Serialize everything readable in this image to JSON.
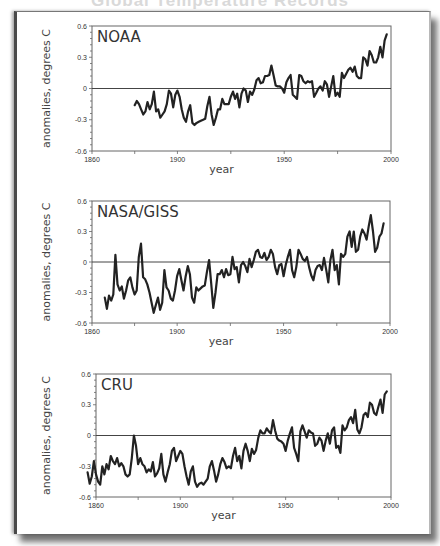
{
  "page": {
    "title_partial": "Global Temperature Records"
  },
  "chart_data": [
    {
      "type": "line",
      "title": "NOAA",
      "xlabel": "year",
      "ylabel": "anomalies, degrees C",
      "xlim": [
        1860,
        2000
      ],
      "ylim": [
        -0.6,
        0.6
      ],
      "xticks": [
        1860,
        1900,
        1950,
        2000
      ],
      "xtick_labels": [
        "1860",
        "1900",
        "1950",
        "2000"
      ],
      "yticks": [
        -0.6,
        -0.3,
        0,
        0.3,
        0.6
      ],
      "ytick_labels": [
        "-0.6",
        "-0.3",
        "0",
        "0.3",
        "0.6"
      ],
      "zero_line": true,
      "box": {
        "x0": 92,
        "x1": 391,
        "y_top": 26,
        "y_bottom": 151
      },
      "x": [
        1880,
        1881,
        1882,
        1883,
        1884,
        1885,
        1886,
        1887,
        1888,
        1889,
        1890,
        1891,
        1892,
        1893,
        1894,
        1895,
        1896,
        1897,
        1898,
        1899,
        1900,
        1901,
        1902,
        1903,
        1904,
        1905,
        1906,
        1907,
        1908,
        1909,
        1910,
        1911,
        1912,
        1913,
        1914,
        1915,
        1916,
        1917,
        1918,
        1919,
        1920,
        1921,
        1922,
        1923,
        1924,
        1925,
        1926,
        1927,
        1928,
        1929,
        1930,
        1931,
        1932,
        1933,
        1934,
        1935,
        1936,
        1937,
        1938,
        1939,
        1940,
        1941,
        1942,
        1943,
        1944,
        1945,
        1946,
        1947,
        1948,
        1949,
        1950,
        1951,
        1952,
        1953,
        1954,
        1955,
        1956,
        1957,
        1958,
        1959,
        1960,
        1961,
        1962,
        1963,
        1964,
        1965,
        1966,
        1967,
        1968,
        1969,
        1970,
        1971,
        1972,
        1973,
        1974,
        1975,
        1976,
        1977,
        1978,
        1979,
        1980,
        1981,
        1982,
        1983,
        1984,
        1985,
        1986,
        1987,
        1988,
        1989,
        1990,
        1991,
        1992,
        1993,
        1994,
        1995,
        1996,
        1997,
        1998
      ],
      "values": [
        -0.16,
        -0.12,
        -0.15,
        -0.2,
        -0.25,
        -0.22,
        -0.13,
        -0.2,
        -0.15,
        -0.03,
        -0.22,
        -0.2,
        -0.28,
        -0.25,
        -0.22,
        -0.15,
        -0.02,
        -0.05,
        -0.18,
        -0.06,
        -0.02,
        -0.08,
        -0.2,
        -0.28,
        -0.32,
        -0.22,
        -0.16,
        -0.33,
        -0.35,
        -0.33,
        -0.32,
        -0.31,
        -0.3,
        -0.29,
        -0.17,
        -0.08,
        -0.25,
        -0.35,
        -0.28,
        -0.2,
        -0.2,
        -0.1,
        -0.15,
        -0.15,
        -0.15,
        -0.08,
        -0.03,
        -0.1,
        -0.05,
        -0.18,
        -0.05,
        0.0,
        -0.02,
        -0.13,
        -0.03,
        -0.06,
        -0.01,
        0.08,
        0.1,
        0.05,
        0.06,
        0.12,
        0.12,
        0.13,
        0.22,
        0.13,
        0.03,
        0.02,
        0.02,
        0.0,
        -0.04,
        0.06,
        0.1,
        0.13,
        -0.06,
        -0.08,
        -0.1,
        0.13,
        0.12,
        0.07,
        0.05,
        0.07,
        0.06,
        0.07,
        -0.08,
        -0.04,
        0.0,
        0.02,
        -0.02,
        0.07,
        0.04,
        -0.08,
        0.02,
        0.12,
        -0.07,
        -0.04,
        -0.08,
        0.15,
        0.1,
        0.14,
        0.18,
        0.2,
        0.16,
        0.21,
        0.12,
        0.1,
        0.1,
        0.3,
        0.28,
        0.22,
        0.36,
        0.32,
        0.25,
        0.25,
        0.3,
        0.4,
        0.3,
        0.46,
        0.52
      ]
    },
    {
      "type": "line",
      "title": "NASA/GISS",
      "xlabel": "year",
      "ylabel": "anomalies, degrees C",
      "xlim": [
        1860,
        2000
      ],
      "ylim": [
        -0.6,
        0.6
      ],
      "xticks": [
        1860,
        1900,
        1950,
        2000
      ],
      "xtick_labels": [
        "1860",
        "1900",
        "1950",
        "2000"
      ],
      "yticks": [
        -0.6,
        -0.3,
        0,
        0.3,
        0.6
      ],
      "ytick_labels": [
        "-0.6",
        "-0.3",
        "0",
        "0.3",
        "0.6"
      ],
      "zero_line": true,
      "box": {
        "x0": 92,
        "x1": 390,
        "y_top": 201,
        "y_bottom": 323
      },
      "x": [
        1866,
        1867,
        1868,
        1869,
        1870,
        1871,
        1872,
        1873,
        1874,
        1875,
        1876,
        1877,
        1878,
        1879,
        1880,
        1881,
        1882,
        1883,
        1884,
        1885,
        1886,
        1887,
        1888,
        1889,
        1890,
        1891,
        1892,
        1893,
        1894,
        1895,
        1896,
        1897,
        1898,
        1899,
        1900,
        1901,
        1902,
        1903,
        1904,
        1905,
        1906,
        1907,
        1908,
        1909,
        1910,
        1911,
        1912,
        1913,
        1914,
        1915,
        1916,
        1917,
        1918,
        1919,
        1920,
        1921,
        1922,
        1923,
        1924,
        1925,
        1926,
        1927,
        1928,
        1929,
        1930,
        1931,
        1932,
        1933,
        1934,
        1935,
        1936,
        1937,
        1938,
        1939,
        1940,
        1941,
        1942,
        1943,
        1944,
        1945,
        1946,
        1947,
        1948,
        1949,
        1950,
        1951,
        1952,
        1953,
        1954,
        1955,
        1956,
        1957,
        1958,
        1959,
        1960,
        1961,
        1962,
        1963,
        1964,
        1965,
        1966,
        1967,
        1968,
        1969,
        1970,
        1971,
        1972,
        1973,
        1974,
        1975,
        1976,
        1977,
        1978,
        1979,
        1980,
        1981,
        1982,
        1983,
        1984,
        1985,
        1986,
        1987,
        1988,
        1989,
        1990,
        1991,
        1992,
        1993,
        1994,
        1995,
        1996,
        1997
      ],
      "values": [
        -0.35,
        -0.46,
        -0.33,
        -0.38,
        -0.32,
        0.07,
        -0.22,
        -0.28,
        -0.24,
        -0.36,
        -0.28,
        -0.18,
        -0.15,
        -0.25,
        -0.32,
        -0.28,
        0.05,
        0.18,
        -0.15,
        -0.17,
        -0.22,
        -0.3,
        -0.4,
        -0.5,
        -0.42,
        -0.35,
        -0.47,
        -0.4,
        -0.08,
        -0.25,
        -0.28,
        -0.36,
        -0.38,
        -0.28,
        -0.14,
        -0.07,
        -0.18,
        -0.28,
        -0.14,
        -0.04,
        -0.12,
        -0.35,
        -0.4,
        -0.25,
        -0.28,
        -0.26,
        -0.24,
        -0.23,
        -0.1,
        0.02,
        -0.21,
        -0.45,
        -0.3,
        -0.12,
        -0.12,
        -0.08,
        -0.15,
        -0.07,
        -0.13,
        -0.12,
        0.05,
        -0.07,
        -0.05,
        -0.2,
        -0.03,
        0.0,
        -0.04,
        -0.1,
        0.03,
        -0.05,
        0.02,
        0.1,
        0.12,
        0.05,
        0.04,
        0.09,
        0.02,
        0.05,
        0.12,
        0.08,
        -0.05,
        -0.12,
        -0.03,
        -0.02,
        -0.14,
        -0.03,
        0.05,
        0.12,
        -0.08,
        -0.15,
        -0.05,
        0.12,
        0.08,
        0.03,
        0.01,
        0.05,
        -0.05,
        -0.13,
        -0.18,
        -0.08,
        -0.04,
        -0.03,
        -0.08,
        0.04,
        -0.07,
        -0.2,
        0.02,
        0.12,
        -0.08,
        -0.03,
        -0.22,
        0.08,
        0.05,
        0.08,
        0.25,
        0.3,
        0.15,
        0.3,
        0.1,
        0.12,
        0.25,
        0.32,
        0.28,
        0.22,
        0.35,
        0.46,
        0.3,
        0.1,
        0.14,
        0.25,
        0.28,
        0.38,
        0.35,
        0.36
      ]
    },
    {
      "type": "line",
      "title": "CRU",
      "xlabel": "year",
      "ylabel": "anomalies, degrees C",
      "xlim": [
        1860,
        2000
      ],
      "ylim": [
        -0.6,
        0.6
      ],
      "xticks": [
        1860,
        1900,
        1950,
        2000
      ],
      "xtick_labels": [
        "1860",
        "1900",
        "1950",
        "2000"
      ],
      "yticks": [
        -0.6,
        -0.3,
        0,
        0.3,
        0.6
      ],
      "ytick_labels": [
        "-0.6",
        "-0.3",
        "0",
        "0.3",
        "0.6"
      ],
      "zero_line": true,
      "box": {
        "x0": 96,
        "x1": 391,
        "y_top": 374,
        "y_bottom": 497
      },
      "x": [
        1856,
        1857,
        1858,
        1859,
        1860,
        1861,
        1862,
        1863,
        1864,
        1865,
        1866,
        1867,
        1868,
        1869,
        1870,
        1871,
        1872,
        1873,
        1874,
        1875,
        1876,
        1877,
        1878,
        1879,
        1880,
        1881,
        1882,
        1883,
        1884,
        1885,
        1886,
        1887,
        1888,
        1889,
        1890,
        1891,
        1892,
        1893,
        1894,
        1895,
        1896,
        1897,
        1898,
        1899,
        1900,
        1901,
        1902,
        1903,
        1904,
        1905,
        1906,
        1907,
        1908,
        1909,
        1910,
        1911,
        1912,
        1913,
        1914,
        1915,
        1916,
        1917,
        1918,
        1919,
        1920,
        1921,
        1922,
        1923,
        1924,
        1925,
        1926,
        1927,
        1928,
        1929,
        1930,
        1931,
        1932,
        1933,
        1934,
        1935,
        1936,
        1937,
        1938,
        1939,
        1940,
        1941,
        1942,
        1943,
        1944,
        1945,
        1946,
        1947,
        1948,
        1949,
        1950,
        1951,
        1952,
        1953,
        1954,
        1955,
        1956,
        1957,
        1958,
        1959,
        1960,
        1961,
        1962,
        1963,
        1964,
        1965,
        1966,
        1967,
        1968,
        1969,
        1970,
        1971,
        1972,
        1973,
        1974,
        1975,
        1976,
        1977,
        1978,
        1979,
        1980,
        1981,
        1982,
        1983,
        1984,
        1985,
        1986,
        1987,
        1988,
        1989,
        1990,
        1991,
        1992,
        1993,
        1994,
        1995,
        1996,
        1997,
        1998
      ],
      "values": [
        -0.36,
        -0.47,
        -0.4,
        -0.25,
        -0.38,
        -0.45,
        -0.48,
        -0.3,
        -0.38,
        -0.28,
        -0.33,
        -0.2,
        -0.25,
        -0.28,
        -0.22,
        -0.3,
        -0.27,
        -0.3,
        -0.38,
        -0.4,
        -0.38,
        -0.22,
        0.0,
        -0.1,
        -0.28,
        -0.22,
        -0.28,
        -0.3,
        -0.36,
        -0.33,
        -0.35,
        -0.26,
        -0.4,
        -0.37,
        -0.32,
        -0.18,
        -0.38,
        -0.45,
        -0.36,
        -0.28,
        -0.15,
        -0.12,
        -0.25,
        -0.2,
        -0.15,
        -0.18,
        -0.3,
        -0.4,
        -0.48,
        -0.35,
        -0.3,
        -0.45,
        -0.5,
        -0.47,
        -0.46,
        -0.48,
        -0.45,
        -0.42,
        -0.3,
        -0.25,
        -0.34,
        -0.45,
        -0.38,
        -0.28,
        -0.22,
        -0.26,
        -0.32,
        -0.3,
        -0.32,
        -0.2,
        -0.12,
        -0.25,
        -0.2,
        -0.32,
        -0.15,
        -0.08,
        -0.15,
        -0.25,
        -0.13,
        -0.18,
        -0.14,
        -0.02,
        0.05,
        0.02,
        0.02,
        0.07,
        0.04,
        0.02,
        0.15,
        0.05,
        -0.03,
        -0.05,
        -0.06,
        -0.08,
        -0.15,
        -0.05,
        0.02,
        0.08,
        -0.12,
        -0.18,
        -0.25,
        0.04,
        0.1,
        0.04,
        -0.02,
        0.05,
        0.03,
        0.02,
        -0.1,
        -0.08,
        -0.02,
        -0.05,
        -0.15,
        -0.05,
        0.02,
        -0.08,
        0.05,
        0.08,
        -0.12,
        -0.1,
        -0.17,
        0.1,
        0.05,
        0.08,
        0.15,
        0.18,
        0.12,
        0.25,
        0.06,
        0.02,
        0.08,
        0.2,
        0.22,
        0.18,
        0.32,
        0.3,
        0.22,
        0.2,
        0.28,
        0.35,
        0.22,
        0.4,
        0.43
      ]
    }
  ]
}
